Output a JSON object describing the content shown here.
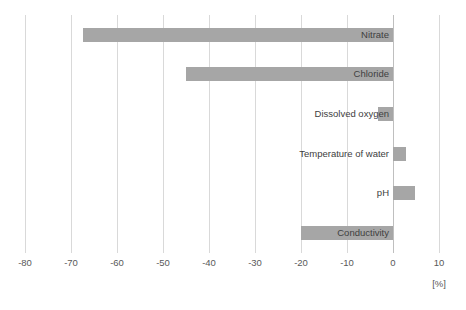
{
  "chart_data": {
    "type": "bar",
    "orientation": "horizontal",
    "title": "",
    "xlabel": "[%]",
    "ylabel": "",
    "xlim": [
      -80,
      10
    ],
    "xticks": [
      -80,
      -70,
      -60,
      -50,
      -40,
      -30,
      -20,
      -10,
      0,
      10
    ],
    "xtick_labels": [
      "-80",
      "-70",
      "-60",
      "-50",
      "-40",
      "-30",
      "-20",
      "-10",
      "0",
      "10"
    ],
    "grid": "vertical",
    "legend": "none",
    "bar_color": "#a6a6a6",
    "gridline_color": "#d9d9d9",
    "label_color": "#404040",
    "categories": [
      "Nitrate",
      "Chloride",
      "Dissolved oxygen",
      "Temperature of water",
      "pH",
      "Conductivity"
    ],
    "values": [
      -67.5,
      -45.0,
      -3.3,
      2.8,
      4.7,
      -20.0
    ]
  },
  "axis": {
    "unit": "[%]"
  }
}
